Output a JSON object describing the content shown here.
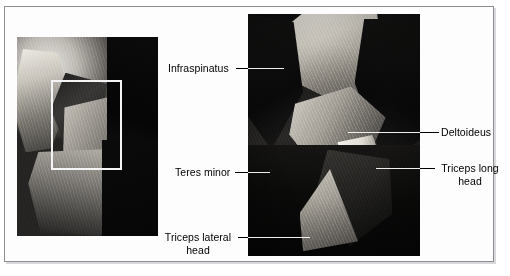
{
  "figure": {
    "background_color": "#ffffff",
    "frame_border_color": "#8e8e92",
    "label_text_color": "#000000",
    "leader_line_color": "#000000",
    "leader_line_color_on_photo": "#efefef",
    "roi_rect_color": "#f4f4f4"
  },
  "panels": [
    {
      "name": "overview-photo",
      "description": "Grayscale anatomical dissection overview of shoulder and upper arm, posterior view"
    },
    {
      "name": "detail-photo",
      "description": "Magnified grayscale dissection of the region outlined in the overview"
    }
  ],
  "labels": {
    "infraspinatus": "Infraspinatus",
    "teres_minor": "Teres minor",
    "triceps_lateral_head_line1": "Triceps lateral",
    "triceps_lateral_head_line2": "head",
    "deltoideus": "Deltoideus",
    "triceps_long_head_line1": "Triceps long",
    "triceps_long_head_line2": "head"
  }
}
